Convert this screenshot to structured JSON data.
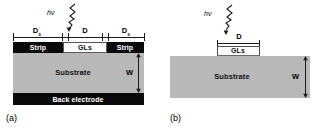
{
  "figure": {
    "panels": [
      {
        "caption": "(a)",
        "light_label": "hν",
        "dimensions": [
          {
            "label": "D",
            "sub": "s",
            "name": "left-strip-width"
          },
          {
            "label": "D",
            "sub": "",
            "name": "gap-width"
          },
          {
            "label": "D",
            "sub": "s",
            "name": "right-strip-width"
          }
        ],
        "thickness_label": "W",
        "layers": [
          {
            "name": "left-strip",
            "label": "Strip"
          },
          {
            "name": "graphene-layer",
            "label": "GLs"
          },
          {
            "name": "right-strip",
            "label": "Strip"
          },
          {
            "name": "substrate",
            "label": "Substrate"
          },
          {
            "name": "back-electrode",
            "label": "Back electrode"
          }
        ]
      },
      {
        "caption": "(b)",
        "light_label": "hν",
        "dimensions": [
          {
            "label": "D",
            "sub": "",
            "name": "gls-width"
          }
        ],
        "thickness_label": "W",
        "layers": [
          {
            "name": "graphene-layer",
            "label": "GLs"
          },
          {
            "name": "substrate",
            "label": "Substrate"
          }
        ]
      }
    ],
    "colors": {
      "electrode": "#0a0a0a",
      "substrate": "#b9b9b9",
      "graphene": "#ffffff",
      "outline": "#1a1a1a",
      "background": "#ffffff"
    }
  }
}
